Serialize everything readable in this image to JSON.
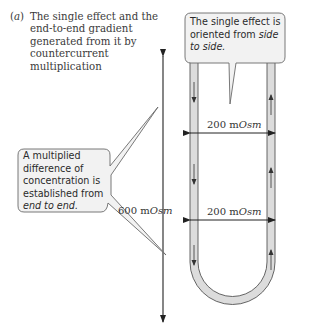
{
  "caption": {
    "label": "a",
    "text": "The single effect and the end-to-end gradient generated from it by countercurrent multiplication"
  },
  "callouts": {
    "top_right": {
      "text_plain": "The single effect is oriented from ",
      "text_italic": "side to side."
    },
    "left": {
      "text_plain": "A multiplied difference of concentration is established from ",
      "text_italic": "end to end."
    }
  },
  "measurements": {
    "vertical": {
      "value": "600 m",
      "unit_italic": "Osm"
    },
    "horizontal_upper": {
      "value": "200 m",
      "unit_italic": "Osm"
    },
    "horizontal_lower": {
      "value": "200 m",
      "unit_italic": "Osm"
    }
  },
  "colors": {
    "tube_fill": "#dcdcdc",
    "tube_stroke": "#555555",
    "callout_fill": "#f2f2f2",
    "callout_stroke": "#6a6a6a",
    "arrow": "#222222",
    "text": "#333333"
  },
  "flow": {
    "left_limb_direction": "down",
    "right_limb_direction": "up"
  }
}
